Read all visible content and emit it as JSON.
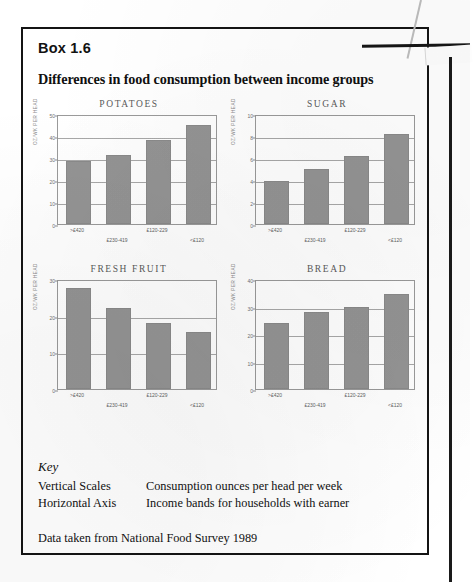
{
  "box": {
    "number_label": "Box 1.6",
    "title": "Differences in food consumption between income groups"
  },
  "key": {
    "heading": "Key",
    "rows": [
      {
        "term": "Vertical Scales",
        "description": "Consumption ounces per head per week"
      },
      {
        "term": "Horizontal Axis",
        "description": "Income bands for households with earner"
      }
    ]
  },
  "source_note": "Data taken from National Food Survey 1989",
  "colors": {
    "bar_fill": "#949494",
    "axis": "#9a9a9a",
    "border": "#141414",
    "text": "#111111"
  },
  "chart_data": [
    {
      "type": "bar",
      "title": "POTATOES",
      "categories": [
        ">£420",
        "£230-419",
        "£120-229",
        "<£120"
      ],
      "values": [
        28.5,
        31.5,
        38.0,
        45.0
      ],
      "xlabel": "",
      "ylabel": "OZ/WK PER HEAD",
      "ylim": [
        0,
        50
      ],
      "yticks": [
        0,
        10,
        20,
        30,
        40,
        50
      ],
      "grid": true,
      "legend": "none"
    },
    {
      "type": "bar",
      "title": "SUGAR",
      "categories": [
        ">£420",
        "£230-419",
        "£120-229",
        "<£120"
      ],
      "values": [
        3.9,
        5.0,
        6.2,
        8.2
      ],
      "xlabel": "",
      "ylabel": "OZ/WK PER HEAD",
      "ylim": [
        0,
        10
      ],
      "yticks": [
        0,
        2,
        4,
        6,
        8,
        10
      ],
      "grid": true,
      "legend": "none"
    },
    {
      "type": "bar",
      "title": "FRESH FRUIT",
      "categories": [
        ">£420",
        "£230-419",
        "£120-229",
        "<£120"
      ],
      "values": [
        27.5,
        22.0,
        18.0,
        15.5
      ],
      "xlabel": "",
      "ylabel": "OZ/WK PER HEAD",
      "ylim": [
        0,
        30
      ],
      "yticks": [
        0,
        10,
        20,
        30
      ],
      "grid": true,
      "legend": "none"
    },
    {
      "type": "bar",
      "title": "BREAD",
      "categories": [
        ">£420",
        "£230-419",
        "£120-229",
        "<£120"
      ],
      "values": [
        24.0,
        28.0,
        30.0,
        34.5
      ],
      "xlabel": "",
      "ylabel": "OZ/WK PER HEAD",
      "ylim": [
        0,
        40
      ],
      "yticks": [
        0,
        10,
        20,
        30,
        40
      ],
      "grid": true,
      "legend": "none"
    }
  ]
}
